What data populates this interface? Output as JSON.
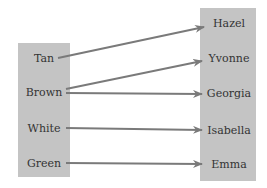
{
  "diagram": {
    "type": "mapping",
    "domain": {
      "items": [
        {
          "label": "Tan",
          "y": 58
        },
        {
          "label": "Brown",
          "y": 92
        },
        {
          "label": "White",
          "y": 128
        },
        {
          "label": "Green",
          "y": 163
        }
      ]
    },
    "range": {
      "items": [
        {
          "label": "Hazel",
          "y": 23
        },
        {
          "label": "Yvonne",
          "y": 58
        },
        {
          "label": "Georgia",
          "y": 93
        },
        {
          "label": "Isabella",
          "y": 130
        },
        {
          "label": "Emma",
          "y": 164
        }
      ]
    },
    "arrows": [
      {
        "from": "Tan",
        "to": "Hazel"
      },
      {
        "from": "Brown",
        "to": "Yvonne"
      },
      {
        "from": "Brown",
        "to": "Georgia"
      },
      {
        "from": "White",
        "to": "Isabella"
      },
      {
        "from": "Green",
        "to": "Emma"
      }
    ],
    "colors": {
      "box": "#c4c4c4",
      "arrow": "#7a7a7a",
      "text": "#333333"
    }
  }
}
